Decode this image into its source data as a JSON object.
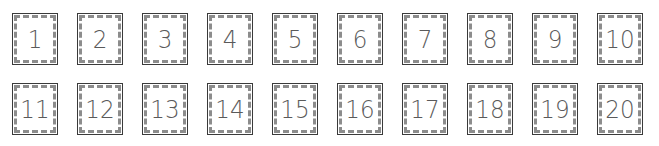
{
  "cards": {
    "items": [
      {
        "label": "1"
      },
      {
        "label": "2"
      },
      {
        "label": "3"
      },
      {
        "label": "4"
      },
      {
        "label": "5"
      },
      {
        "label": "6"
      },
      {
        "label": "7"
      },
      {
        "label": "8"
      },
      {
        "label": "9"
      },
      {
        "label": "10"
      },
      {
        "label": "11"
      },
      {
        "label": "12"
      },
      {
        "label": "13"
      },
      {
        "label": "14"
      },
      {
        "label": "15"
      },
      {
        "label": "16"
      },
      {
        "label": "17"
      },
      {
        "label": "18"
      },
      {
        "label": "19"
      },
      {
        "label": "20"
      }
    ]
  },
  "colors": {
    "border": "#3a3a3a",
    "dash": "#8c8c8c",
    "digit": "#5a5a5a",
    "background": "#ffffff"
  }
}
